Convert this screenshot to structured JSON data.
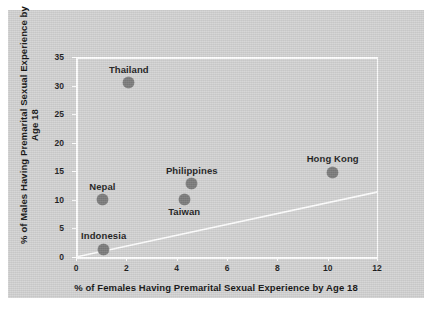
{
  "chart_data": {
    "type": "scatter",
    "title": "",
    "xlabel": "% of Females Having Premarital Sexual Experience by Age 18",
    "ylabel": "% of Males Having Premarital Sexual Experience by Age 18",
    "xlim": [
      0,
      12
    ],
    "ylim": [
      0,
      35
    ],
    "xticks": [
      "0",
      "2",
      "4",
      "6",
      "8",
      "10",
      "12"
    ],
    "xtick_values": [
      0,
      2,
      4,
      6,
      8,
      10,
      12
    ],
    "yticks": [
      "0",
      "5",
      "10",
      "15",
      "20",
      "25",
      "30",
      "35"
    ],
    "ytick_values": [
      0,
      5,
      10,
      15,
      20,
      25,
      30,
      35
    ],
    "grid": false,
    "legend": "none",
    "points": [
      {
        "label": "Thailand",
        "x": 2.1,
        "y": 30.5,
        "label_pos": "above"
      },
      {
        "label": "Hong Kong",
        "x": 10.2,
        "y": 14.8,
        "label_pos": "above"
      },
      {
        "label": "Philippines",
        "x": 4.6,
        "y": 12.8,
        "label_pos": "above"
      },
      {
        "label": "Nepal",
        "x": 1.05,
        "y": 10.0,
        "label_pos": "above"
      },
      {
        "label": "Taiwan",
        "x": 4.3,
        "y": 10.1,
        "label_pos": "below"
      },
      {
        "label": "Indonesia",
        "x": 1.1,
        "y": 1.4,
        "label_pos": "above"
      }
    ],
    "reference_line": {
      "name": "diagonal-reference-line",
      "from": {
        "x": 0,
        "y": 0
      },
      "to": {
        "x": 12,
        "y": 11.4
      }
    },
    "colors": {
      "figure_background": "#d2d2d2",
      "page_background": "#ffffff",
      "marker": "#7b7b7b",
      "axis": "#ffffff",
      "text": "#1b1b1b"
    }
  }
}
